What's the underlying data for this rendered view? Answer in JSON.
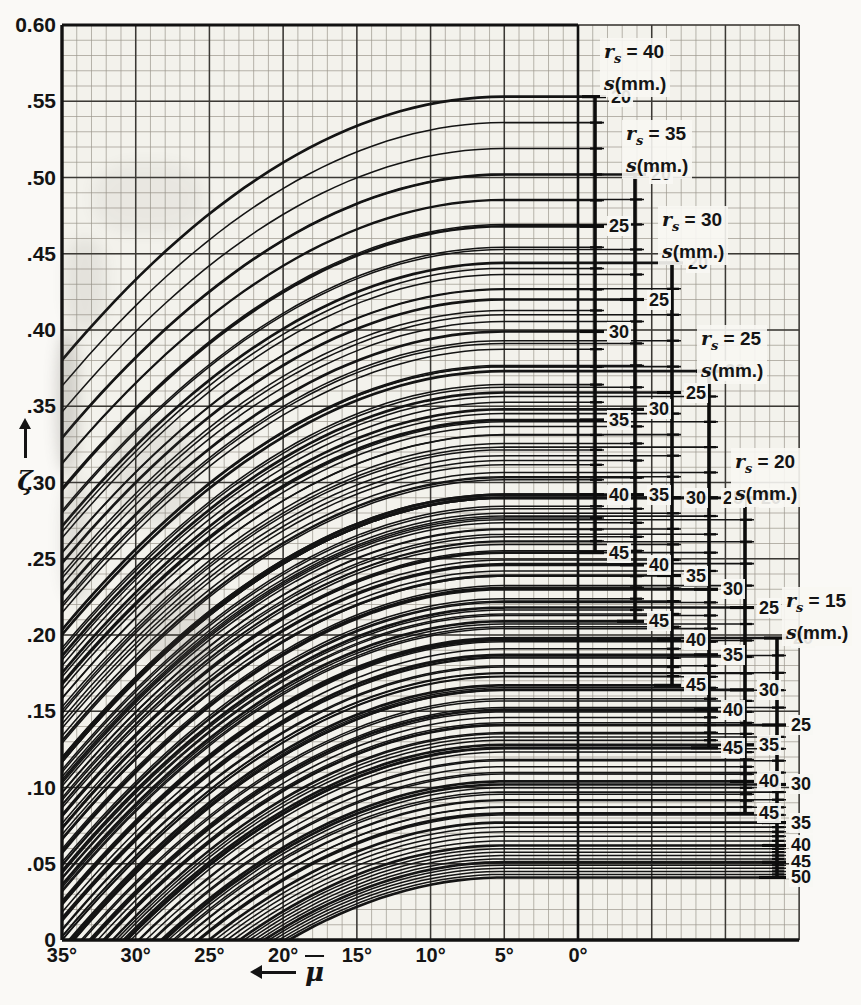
{
  "figure_type": "scanned nomogram chart (family of curves with auxiliary s-scales)",
  "colors": {
    "ink": "#141414",
    "paper": "#faf9f6",
    "grid_area": "#f3f2ec",
    "grid_fine": "#9b968d",
    "grid_major": "#3b3935",
    "bar_ink": "#0c0c0c"
  },
  "y_axis": {
    "symbol": "ζ",
    "ticks": [
      {
        "label": "0.60",
        "value": 0.6
      },
      {
        "label": ".55",
        "value": 0.55
      },
      {
        "label": ".50",
        "value": 0.5
      },
      {
        "label": ".45",
        "value": 0.45
      },
      {
        "label": ".40",
        "value": 0.4
      },
      {
        "label": ".35",
        "value": 0.35
      },
      {
        "label": ".30",
        "value": 0.3
      },
      {
        "label": ".25",
        "value": 0.25
      },
      {
        "label": ".20",
        "value": 0.2
      },
      {
        "label": ".15",
        "value": 0.15
      },
      {
        "label": ".10",
        "value": 0.1
      },
      {
        "label": ".05",
        "value": 0.05
      },
      {
        "label": "0",
        "value": 0.0
      }
    ]
  },
  "x_axis": {
    "symbol": "μ",
    "symbol_decoration": "overline",
    "unit": "degrees",
    "direction": "values increase to the left (arrow points left)",
    "ticks": [
      {
        "label": "35°",
        "value": 35
      },
      {
        "label": "30°",
        "value": 30
      },
      {
        "label": "25°",
        "value": 25
      },
      {
        "label": "20°",
        "value": 20
      },
      {
        "label": "15°",
        "value": 15
      },
      {
        "label": "10°",
        "value": 10
      },
      {
        "label": "5°",
        "value": 5
      },
      {
        "label": "0°",
        "value": 0
      }
    ]
  },
  "chart_data": {
    "type": "line",
    "title": "",
    "xlabel": "μ̄ (degrees, increasing leftward)",
    "ylabel": "ζ",
    "xlim": [
      35,
      0
    ],
    "ylim": [
      0,
      0.6
    ],
    "grid": {
      "on": true,
      "minor_x_deg": 1,
      "major_x_deg": 5,
      "minor_y": 0.01,
      "major_y": 0.05
    },
    "curve_family": {
      "description": "One curve per scale tick (1 mm steps of s, heavy every 5 mm). Each curve is flat from its scale leftward to μ̄≈5°, then falls quadratically toward μ̄=35°, clipped at ζ=0.",
      "flat_for_mu_below_deg": 5,
      "quadratic_k_per_deg2": 0.000192,
      "minor_steps_between_major_ticks": 4
    },
    "scales": [
      {
        "rs": 40,
        "header_line2": "s(mm.)",
        "x_px": 595,
        "ticks": [
          {
            "s": 20,
            "zeta": 0.553
          },
          {
            "s": 25,
            "zeta": 0.468
          },
          {
            "s": 30,
            "zeta": 0.399
          },
          {
            "s": 35,
            "zeta": 0.341
          },
          {
            "s": 40,
            "zeta": 0.292
          },
          {
            "s": 45,
            "zeta": 0.254
          }
        ]
      },
      {
        "rs": 35,
        "header_line2": "s(mm.)",
        "x_px": 635,
        "ticks": [
          {
            "s": 20,
            "zeta": 0.502
          },
          {
            "s": 25,
            "zeta": 0.42
          },
          {
            "s": 30,
            "zeta": 0.348
          },
          {
            "s": 35,
            "zeta": 0.292
          },
          {
            "s": 40,
            "zeta": 0.246
          },
          {
            "s": 45,
            "zeta": 0.209
          }
        ]
      },
      {
        "rs": 30,
        "header_line2": "s(mm.)",
        "x_px": 672,
        "ticks": [
          {
            "s": 20,
            "zeta": 0.444
          },
          {
            "s": 25,
            "zeta": 0.359
          },
          {
            "s": 30,
            "zeta": 0.29
          },
          {
            "s": 35,
            "zeta": 0.239
          },
          {
            "s": 40,
            "zeta": 0.197
          },
          {
            "s": 45,
            "zeta": 0.167
          }
        ]
      },
      {
        "rs": 25,
        "header_line2": "s(mm.)",
        "x_px": 709,
        "ticks": [
          {
            "s": 20,
            "zeta": 0.373
          },
          {
            "s": 25,
            "zeta": 0.29
          },
          {
            "s": 30,
            "zeta": 0.23
          },
          {
            "s": 35,
            "zeta": 0.187
          },
          {
            "s": 40,
            "zeta": 0.151
          },
          {
            "s": 45,
            "zeta": 0.126
          }
        ]
      },
      {
        "rs": 20,
        "header_line2": "s(mm.)",
        "x_px": 745,
        "ticks": [
          {
            "s": 20,
            "zeta": 0.29
          },
          {
            "s": 25,
            "zeta": 0.218
          },
          {
            "s": 30,
            "zeta": 0.164
          },
          {
            "s": 35,
            "zeta": 0.128
          },
          {
            "s": 40,
            "zeta": 0.104
          },
          {
            "s": 45,
            "zeta": 0.083
          }
        ]
      },
      {
        "rs": 15,
        "header_line2": "s(mm.)",
        "x_px": 777,
        "ticks": [
          {
            "s": 20,
            "zeta": 0.198
          },
          {
            "s": 25,
            "zeta": 0.141
          },
          {
            "s": 30,
            "zeta": 0.102
          },
          {
            "s": 35,
            "zeta": 0.077
          },
          {
            "s": 40,
            "zeta": 0.062
          },
          {
            "s": 45,
            "zeta": 0.051
          },
          {
            "s": 50,
            "zeta": 0.041
          }
        ]
      }
    ]
  }
}
